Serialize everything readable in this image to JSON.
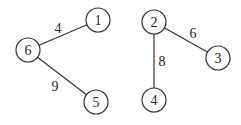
{
  "graph": {
    "nodes": [
      {
        "id": "1",
        "label": "1",
        "x": 98,
        "y": 20
      },
      {
        "id": "6",
        "label": "6",
        "x": 28,
        "y": 50
      },
      {
        "id": "5",
        "label": "5",
        "x": 96,
        "y": 102
      },
      {
        "id": "2",
        "label": "2",
        "x": 154,
        "y": 22
      },
      {
        "id": "3",
        "label": "3",
        "x": 218,
        "y": 58
      },
      {
        "id": "4",
        "label": "4",
        "x": 154,
        "y": 100
      }
    ],
    "edges": [
      {
        "from": "6",
        "to": "1",
        "weight": "4",
        "lx": 58,
        "ly": 33
      },
      {
        "from": "6",
        "to": "5",
        "weight": "9",
        "lx": 55,
        "ly": 91
      },
      {
        "from": "2",
        "to": "3",
        "weight": "6",
        "lx": 193,
        "ly": 38
      },
      {
        "from": "2",
        "to": "4",
        "weight": "8",
        "lx": 162,
        "ly": 66
      }
    ]
  }
}
